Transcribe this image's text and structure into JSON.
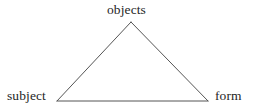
{
  "diagram": {
    "background_color": "#ffffff",
    "line_color": "#555555",
    "text_color": "#262626",
    "nodes": [
      {
        "id": "objects",
        "label": "objects",
        "position": "top",
        "vertex": {
          "x": 131,
          "y": 22
        },
        "label_position": {
          "x": 107,
          "y": 3
        }
      },
      {
        "id": "subject",
        "label": "subject",
        "position": "bottom-left",
        "vertex": {
          "x": 57,
          "y": 101
        },
        "label_position": {
          "x": 7,
          "y": 89
        }
      },
      {
        "id": "form",
        "label": "form",
        "position": "bottom-right",
        "vertex": {
          "x": 208,
          "y": 101
        },
        "label_position": {
          "x": 215,
          "y": 89
        }
      }
    ],
    "edges": [
      {
        "id": "subject-objects",
        "from": "subject",
        "to": "objects"
      },
      {
        "id": "objects-form",
        "from": "objects",
        "to": "form"
      },
      {
        "id": "subject-form",
        "from": "subject",
        "to": "form"
      }
    ],
    "shape": {
      "type": "triangle",
      "points": "131,22 57,101 208,101",
      "stroke_width": 1
    }
  }
}
